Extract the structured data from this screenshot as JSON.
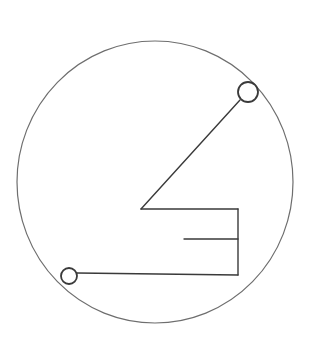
{
  "diagram": {
    "type": "line-drawing",
    "colors": {
      "background": "#ffffff",
      "stroke": "#3a3a3a",
      "outline": "#6e6e6e"
    },
    "outer_circle": {
      "cx": 155,
      "cy": 182,
      "rx": 138,
      "ry": 141
    },
    "terminals": [
      {
        "name": "terminal-top-right",
        "cx": 248,
        "cy": 92,
        "r": 10
      },
      {
        "name": "terminal-bottom-left",
        "cx": 69,
        "cy": 276,
        "r": 8
      }
    ],
    "segments": [
      {
        "name": "diagonal-arm",
        "x1": 240,
        "y1": 100,
        "x2": 141,
        "y2": 209
      },
      {
        "name": "top-bar",
        "x1": 141,
        "y1": 209,
        "x2": 238,
        "y2": 209
      },
      {
        "name": "right-spine",
        "x1": 238,
        "y1": 209,
        "x2": 238,
        "y2": 275
      },
      {
        "name": "middle-prong",
        "x1": 184,
        "y1": 239,
        "x2": 238,
        "y2": 239
      },
      {
        "name": "bottom-bar",
        "x1": 77,
        "y1": 273,
        "x2": 238,
        "y2": 275
      }
    ]
  }
}
